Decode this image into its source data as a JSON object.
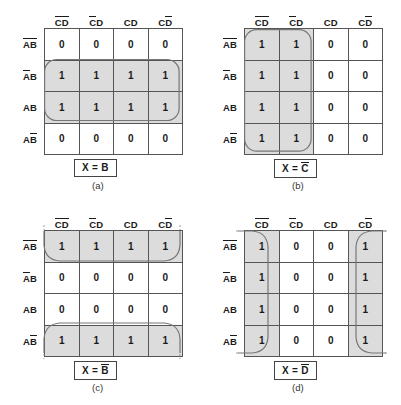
{
  "figure": {
    "title": "Karnaugh map simplification examples",
    "shade_color": "#dcdcdc",
    "grid_color": "#555555",
    "group_color": "#777777"
  },
  "maps": [
    {
      "id": "a",
      "caption": "(a)",
      "result": "X = B",
      "result_parts": [
        {
          "text": "X = ",
          "bar": false
        },
        {
          "text": "B",
          "bar": false
        }
      ],
      "col_headers": [
        {
          "text": "CD",
          "bars": "both"
        },
        {
          "text": "CD",
          "bars": "first"
        },
        {
          "text": "CD",
          "bars": "none"
        },
        {
          "text": "CD",
          "bars": "second"
        }
      ],
      "row_headers": [
        {
          "text": "AB",
          "bars": "both"
        },
        {
          "text": "AB",
          "bars": "first"
        },
        {
          "text": "AB",
          "bars": "none"
        },
        {
          "text": "AB",
          "bars": "second"
        }
      ],
      "cells": [
        [
          "0",
          "0",
          "0",
          "0"
        ],
        [
          "1",
          "1",
          "1",
          "1"
        ],
        [
          "1",
          "1",
          "1",
          "1"
        ],
        [
          "0",
          "0",
          "0",
          "0"
        ]
      ],
      "shaded": [
        [
          false,
          false,
          false,
          false
        ],
        [
          true,
          true,
          true,
          true
        ],
        [
          true,
          true,
          true,
          true
        ],
        [
          false,
          false,
          false,
          false
        ]
      ],
      "group_type": "rows-1-2"
    },
    {
      "id": "b",
      "caption": "(b)",
      "result": "X = C",
      "result_parts": [
        {
          "text": "X = ",
          "bar": false
        },
        {
          "text": "C",
          "bar": true
        }
      ],
      "col_headers": [
        {
          "text": "CD",
          "bars": "both"
        },
        {
          "text": "CD",
          "bars": "first"
        },
        {
          "text": "CD",
          "bars": "none"
        },
        {
          "text": "CD",
          "bars": "second"
        }
      ],
      "row_headers": [
        {
          "text": "AB",
          "bars": "both"
        },
        {
          "text": "AB",
          "bars": "first"
        },
        {
          "text": "AB",
          "bars": "none"
        },
        {
          "text": "AB",
          "bars": "second"
        }
      ],
      "cells": [
        [
          "1",
          "1",
          "0",
          "0"
        ],
        [
          "1",
          "1",
          "0",
          "0"
        ],
        [
          "1",
          "1",
          "0",
          "0"
        ],
        [
          "1",
          "1",
          "0",
          "0"
        ]
      ],
      "shaded": [
        [
          true,
          true,
          false,
          false
        ],
        [
          true,
          true,
          false,
          false
        ],
        [
          true,
          true,
          false,
          false
        ],
        [
          true,
          true,
          false,
          false
        ]
      ],
      "group_type": "cols-0-1"
    },
    {
      "id": "c",
      "caption": "(c)",
      "result": "X = B",
      "result_parts": [
        {
          "text": "X = ",
          "bar": false
        },
        {
          "text": "B",
          "bar": true
        }
      ],
      "col_headers": [
        {
          "text": "CD",
          "bars": "both"
        },
        {
          "text": "CD",
          "bars": "first"
        },
        {
          "text": "CD",
          "bars": "none"
        },
        {
          "text": "CD",
          "bars": "second"
        }
      ],
      "row_headers": [
        {
          "text": "AB",
          "bars": "both"
        },
        {
          "text": "AB",
          "bars": "first"
        },
        {
          "text": "AB",
          "bars": "none"
        },
        {
          "text": "AB",
          "bars": "second"
        }
      ],
      "cells": [
        [
          "1",
          "1",
          "1",
          "1"
        ],
        [
          "0",
          "0",
          "0",
          "0"
        ],
        [
          "0",
          "0",
          "0",
          "0"
        ],
        [
          "1",
          "1",
          "1",
          "1"
        ]
      ],
      "shaded": [
        [
          true,
          true,
          true,
          true
        ],
        [
          false,
          false,
          false,
          false
        ],
        [
          false,
          false,
          false,
          false
        ],
        [
          true,
          true,
          true,
          true
        ]
      ],
      "group_type": "wrap-rows-top-bottom"
    },
    {
      "id": "d",
      "caption": "(d)",
      "result": "X = D",
      "result_parts": [
        {
          "text": "X = ",
          "bar": false
        },
        {
          "text": "D",
          "bar": true
        }
      ],
      "col_headers": [
        {
          "text": "CD",
          "bars": "both"
        },
        {
          "text": "CD",
          "bars": "first"
        },
        {
          "text": "CD",
          "bars": "none"
        },
        {
          "text": "CD",
          "bars": "second"
        }
      ],
      "row_headers": [
        {
          "text": "AB",
          "bars": "both"
        },
        {
          "text": "AB",
          "bars": "first"
        },
        {
          "text": "AB",
          "bars": "none"
        },
        {
          "text": "AB",
          "bars": "second"
        }
      ],
      "cells": [
        [
          "1",
          "0",
          "0",
          "1"
        ],
        [
          "1",
          "0",
          "0",
          "1"
        ],
        [
          "1",
          "0",
          "0",
          "1"
        ],
        [
          "1",
          "0",
          "0",
          "1"
        ]
      ],
      "shaded": [
        [
          true,
          false,
          false,
          true
        ],
        [
          true,
          false,
          false,
          true
        ],
        [
          true,
          false,
          false,
          true
        ],
        [
          true,
          false,
          false,
          true
        ]
      ],
      "group_type": "wrap-cols-left-right"
    }
  ]
}
